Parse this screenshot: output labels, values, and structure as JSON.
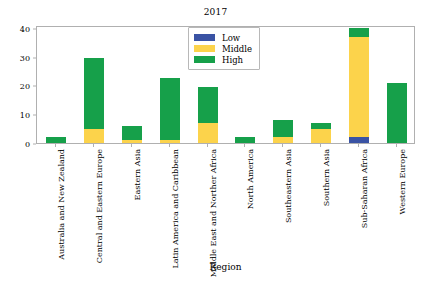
{
  "chart_data": {
    "type": "bar",
    "subtype": "stacked",
    "title": "2017",
    "xlabel": "Region",
    "ylabel": "",
    "ylim": [
      0,
      41
    ],
    "yticks": [
      0,
      10,
      20,
      30,
      40
    ],
    "grid": false,
    "legend_position": "upper center",
    "categories": [
      "Australia and New Zealand",
      "Central and Eastern Europe",
      "Eastern Asia",
      "Latin America and Caribbean",
      "Middle East and Norther Africa",
      "North America",
      "Southeastern Asia",
      "Southern Asia",
      "Sub-Saharan Africa",
      "Western Europe"
    ],
    "series": [
      {
        "name": "Low",
        "color": "#3a53a4",
        "values": [
          0,
          0,
          0,
          0,
          0,
          0,
          0,
          0,
          2,
          0
        ]
      },
      {
        "name": "Middle",
        "color": "#fcd34b",
        "values": [
          0,
          5,
          1,
          1,
          7,
          0,
          2,
          5,
          35,
          0
        ]
      },
      {
        "name": "High",
        "color": "#16a04a",
        "values": [
          2,
          24.5,
          5,
          21.5,
          12.5,
          2,
          6,
          2,
          3,
          21
        ]
      }
    ],
    "totals": [
      2,
      29.5,
      6,
      22.5,
      19.5,
      2,
      8,
      7,
      40,
      21
    ]
  }
}
